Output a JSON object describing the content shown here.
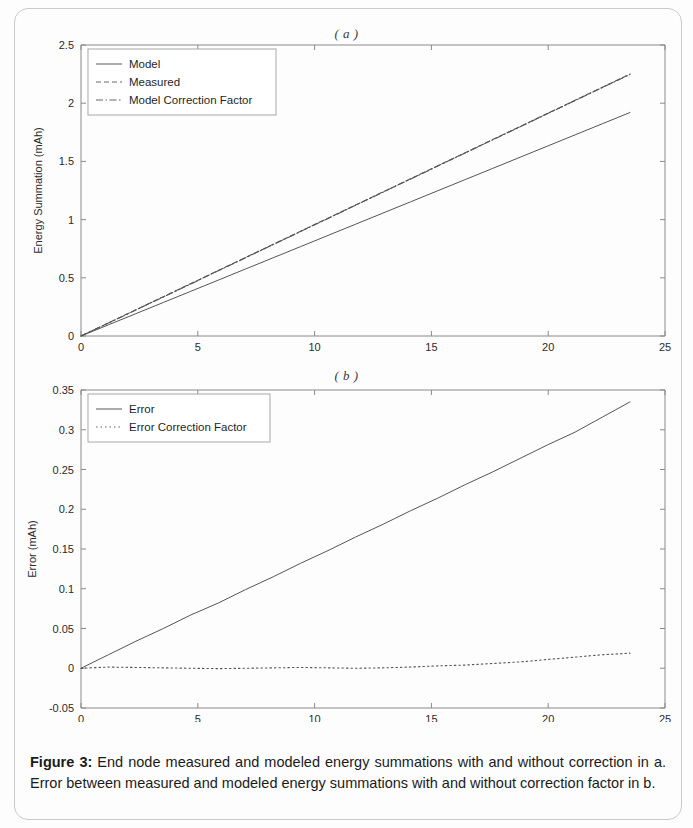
{
  "caption": {
    "label": "Figure 3:",
    "text": " End node measured and modeled energy summations with and without correction in a. Error between measured and modeled energy summations with and without correction factor in b."
  },
  "chart_data": [
    {
      "type": "line",
      "title": "( a )",
      "xlabel": "Time (hr)",
      "ylabel": "Energy Summation (mAh)",
      "xlim": [
        0,
        25
      ],
      "ylim": [
        0,
        2.5
      ],
      "xticks": [
        "0",
        "5",
        "10",
        "15",
        "20",
        "25"
      ],
      "xtick_values": [
        0,
        5,
        10,
        15,
        20,
        25
      ],
      "yticks": [
        "0",
        "0.5",
        "1",
        "1.5",
        "2",
        "2.5"
      ],
      "ytick_values": [
        0,
        0.5,
        1,
        1.5,
        2,
        2.5
      ],
      "grid": false,
      "legend_position": "upper left",
      "x": [
        0,
        1.175,
        2.35,
        3.525,
        4.7,
        5.875,
        7.05,
        8.225,
        9.4,
        10.575,
        11.75,
        12.925,
        14.1,
        15.275,
        16.45,
        17.625,
        18.8,
        19.975,
        21.15,
        22.325,
        23.5
      ],
      "series": [
        {
          "name": "Model",
          "style": "solid",
          "values": [
            0,
            0.096,
            0.192,
            0.288,
            0.384,
            0.48,
            0.576,
            0.672,
            0.768,
            0.864,
            0.96,
            1.056,
            1.152,
            1.248,
            1.344,
            1.44,
            1.536,
            1.632,
            1.728,
            1.824,
            1.92
          ]
        },
        {
          "name": "Measured",
          "style": "dashed",
          "values": [
            0,
            0.1125,
            0.225,
            0.3375,
            0.45,
            0.5625,
            0.675,
            0.7875,
            0.9,
            1.0125,
            1.125,
            1.2375,
            1.35,
            1.4625,
            1.575,
            1.6875,
            1.8,
            1.9125,
            2.025,
            2.1375,
            2.25
          ]
        },
        {
          "name": "Model Correction Factor",
          "style": "dashdot",
          "values": [
            0,
            0.1115,
            0.2235,
            0.3355,
            0.4475,
            0.5605,
            0.6725,
            0.7855,
            0.8975,
            1.0105,
            1.1225,
            1.2355,
            1.3475,
            1.4605,
            1.5725,
            1.6855,
            1.7975,
            1.9105,
            2.0225,
            2.1355,
            2.2475
          ]
        }
      ]
    },
    {
      "type": "line",
      "title": "( b )",
      "xlabel": "Time (hr)",
      "ylabel": "Error (mAh)",
      "xlim": [
        0,
        25
      ],
      "ylim": [
        -0.05,
        0.35
      ],
      "xticks": [
        "0",
        "5",
        "10",
        "15",
        "20",
        "25"
      ],
      "xtick_values": [
        0,
        5,
        10,
        15,
        20,
        25
      ],
      "yticks": [
        "-0.05",
        "0",
        "0.05",
        "0.1",
        "0.15",
        "0.2",
        "0.25",
        "0.3",
        "0.35"
      ],
      "ytick_values": [
        -0.05,
        0,
        0.05,
        0.1,
        0.15,
        0.2,
        0.25,
        0.3,
        0.35
      ],
      "grid": false,
      "legend_position": "upper left",
      "x": [
        0,
        1.175,
        2.35,
        3.525,
        4.7,
        5.875,
        7.05,
        8.225,
        9.4,
        10.575,
        11.75,
        12.925,
        14.1,
        15.275,
        16.45,
        17.625,
        18.8,
        19.975,
        21.15,
        22.325,
        23.5
      ],
      "series": [
        {
          "name": "Error",
          "style": "solid",
          "values": [
            0,
            0.017,
            0.034,
            0.05,
            0.067,
            0.082,
            0.099,
            0.115,
            0.132,
            0.148,
            0.165,
            0.181,
            0.198,
            0.214,
            0.231,
            0.247,
            0.264,
            0.281,
            0.297,
            0.316,
            0.335
          ]
        },
        {
          "name": "Error Correction Factor",
          "style": "dotted",
          "values": [
            0,
            0.0015,
            0.001,
            0.0005,
            0.0,
            -0.0005,
            0.0,
            0.0005,
            0.001,
            0.0005,
            0.0,
            0.0005,
            0.0015,
            0.003,
            0.004,
            0.006,
            0.008,
            0.011,
            0.014,
            0.017,
            0.019
          ]
        }
      ]
    }
  ]
}
